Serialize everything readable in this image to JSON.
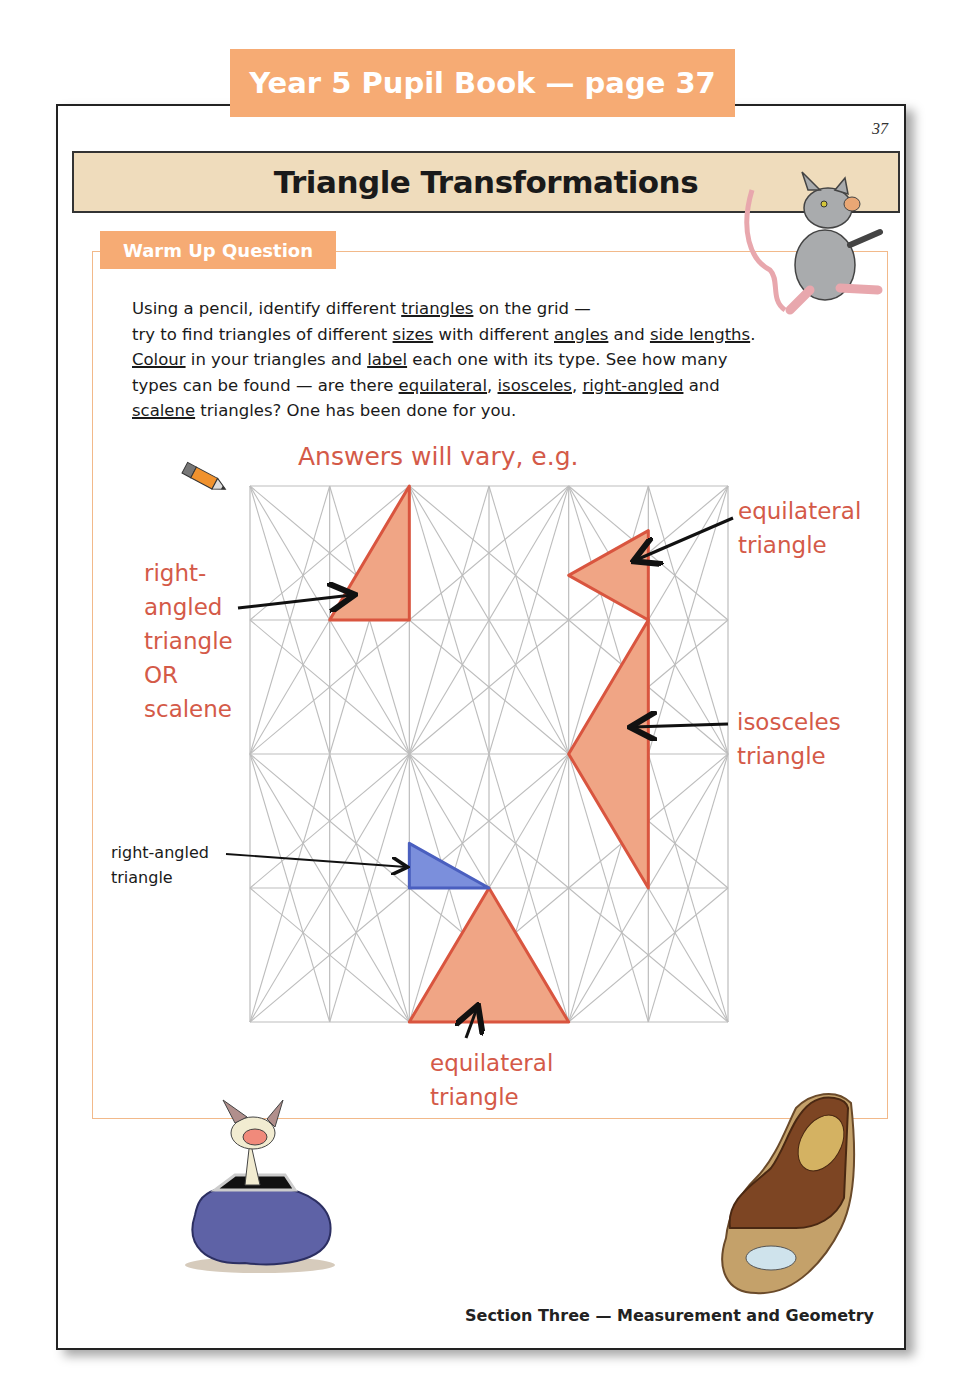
{
  "banner": {
    "text": "Year 5 Pupil Book — page 37",
    "color": "#f6ab74"
  },
  "page": {
    "number": "37",
    "title": "Triangle Transformations",
    "title_bg": "#efdcbc"
  },
  "question": {
    "tab_label": "Warm Up Question",
    "lines": [
      [
        {
          "t": "Using a pencil, identify different "
        },
        {
          "t": "triangles",
          "u": true
        },
        {
          "t": " on the grid —"
        }
      ],
      [
        {
          "t": "try to find triangles of different "
        },
        {
          "t": "sizes",
          "u": true
        },
        {
          "t": " with different "
        },
        {
          "t": "angles",
          "u": true
        },
        {
          "t": " and "
        },
        {
          "t": "side lengths",
          "u": true
        },
        {
          "t": "."
        }
      ],
      [
        {
          "t": "Colour",
          "u": true
        },
        {
          "t": " in your triangles and "
        },
        {
          "t": "label",
          "u": true
        },
        {
          "t": " each one with its type.  See how many"
        }
      ],
      [
        {
          "t": "types can be found — are there "
        },
        {
          "t": "equilateral",
          "u": true
        },
        {
          "t": ", "
        },
        {
          "t": "isosceles",
          "u": true
        },
        {
          "t": ", "
        },
        {
          "t": "right-angled",
          "u": true
        },
        {
          "t": " and"
        }
      ],
      [
        {
          "t": "scalene",
          "u": true
        },
        {
          "t": " triangles?  One has been done for you."
        }
      ]
    ]
  },
  "answer": {
    "heading": "Answers will vary, e.g.",
    "color": "#d45a48",
    "labels": {
      "left_red": [
        "right-",
        "angled",
        "triangle",
        "OR",
        "scalene"
      ],
      "top_right": [
        "equilateral",
        "triangle"
      ],
      "mid_right": [
        "isosceles",
        "triangle"
      ],
      "bottom": [
        "equilateral",
        "triangle"
      ],
      "example_black": [
        "right-angled",
        "triangle"
      ]
    }
  },
  "grid": {
    "cols": 6,
    "rows": 4,
    "line_color": "#bdbdbd",
    "fill_orange": "#f0a585",
    "stroke_orange": "#d9553f",
    "fill_blue": "#7b8fdc",
    "stroke_blue": "#4a5fbf"
  },
  "footer": {
    "text": "Section Three — Measurement and Geometry"
  },
  "illustrations": [
    "rat-walking",
    "pencil",
    "mouse-in-purse",
    "mouse-in-shoe"
  ]
}
